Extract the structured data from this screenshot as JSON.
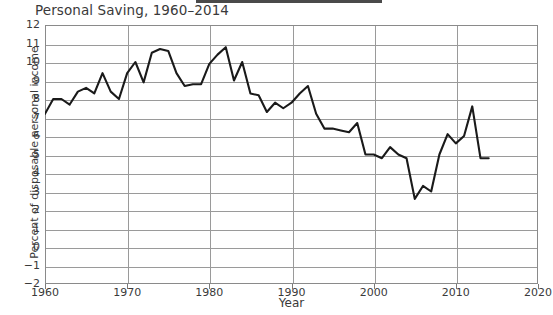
{
  "chart_data": {
    "type": "line",
    "title": "Personal Saving, 1960–2014",
    "xlabel": "Year",
    "ylabel": "Percent of disposable personal income",
    "xlim": [
      1960,
      2020
    ],
    "ylim": [
      -2,
      12
    ],
    "grid": true,
    "legend": "none",
    "xticks": [
      1960,
      1970,
      1980,
      1990,
      2000,
      2010,
      2020
    ],
    "yticks": [
      -2,
      -1,
      0,
      1,
      2,
      3,
      4,
      5,
      6,
      7,
      8,
      9,
      10,
      11,
      12
    ],
    "series": [
      {
        "name": "Personal saving rate",
        "color": "#1a1a1a",
        "x": [
          1960,
          1961,
          1962,
          1963,
          1964,
          1965,
          1966,
          1967,
          1968,
          1969,
          1970,
          1971,
          1972,
          1973,
          1974,
          1975,
          1976,
          1977,
          1978,
          1979,
          1980,
          1981,
          1982,
          1983,
          1984,
          1985,
          1986,
          1987,
          1988,
          1989,
          1990,
          1991,
          1992,
          1993,
          1994,
          1995,
          1996,
          1997,
          1998,
          1999,
          2000,
          2001,
          2002,
          2003,
          2004,
          2005,
          2006,
          2007,
          2008,
          2009,
          2010,
          2011,
          2012,
          2013,
          2014
        ],
        "y": [
          7.2,
          8.0,
          8.0,
          7.7,
          8.4,
          8.6,
          8.3,
          9.4,
          8.4,
          8.0,
          9.4,
          10.0,
          8.9,
          10.5,
          10.7,
          10.6,
          9.4,
          8.7,
          8.8,
          8.8,
          9.9,
          10.4,
          10.8,
          9.0,
          10.0,
          8.3,
          8.2,
          7.3,
          7.8,
          7.5,
          7.8,
          8.3,
          8.7,
          7.2,
          6.4,
          6.4,
          6.3,
          6.2,
          6.7,
          5.0,
          5.0,
          4.8,
          5.4,
          5.0,
          4.8,
          2.6,
          3.3,
          3.0,
          5.0,
          6.1,
          5.6,
          6.0,
          7.6,
          4.8,
          4.8
        ]
      }
    ]
  },
  "axis": {
    "x_tick_labels": [
      "1960",
      "1970",
      "1980",
      "1990",
      "2000",
      "2010",
      "2020"
    ],
    "y_tick_labels": [
      "12",
      "11",
      "10",
      "9",
      "8",
      "7",
      "6",
      "5",
      "4",
      "3",
      "2",
      "1",
      "0",
      "−1",
      "−2"
    ]
  }
}
